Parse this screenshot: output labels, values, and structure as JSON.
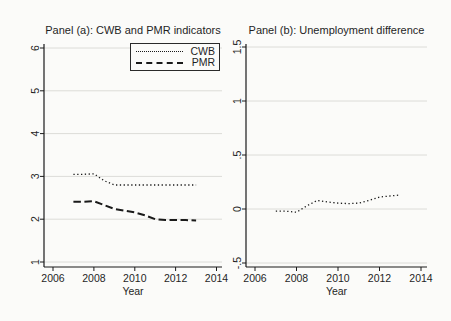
{
  "figure": {
    "background": "#fbfbf9",
    "line_color": "#1a1a1a",
    "grid_color": "#dcdcd8",
    "text_color": "#1f1f1f"
  },
  "chart_data": [
    {
      "id": "panel-a",
      "type": "line",
      "title": "Panel (a): CWB and PMR indicators",
      "xlabel": "Year",
      "ylabel": "",
      "xlim": [
        2006,
        2014
      ],
      "ylim": [
        1,
        6
      ],
      "xticks": [
        2006,
        2008,
        2010,
        2012,
        2014
      ],
      "yticks": [
        1,
        2,
        3,
        4,
        5,
        6
      ],
      "ytick_labels": [
        "1",
        "2",
        "3",
        "4",
        "5",
        "6"
      ],
      "grid": "horizontal",
      "legend_position": "top-right-inside",
      "series": [
        {
          "name": "CWB",
          "style": "dotted",
          "x": [
            2007,
            2007.5,
            2008,
            2008.5,
            2009,
            2009.5,
            2010,
            2010.5,
            2011,
            2011.5,
            2012,
            2012.5,
            2013
          ],
          "y": [
            3.05,
            3.05,
            3.06,
            2.9,
            2.8,
            2.8,
            2.8,
            2.8,
            2.8,
            2.8,
            2.8,
            2.8,
            2.8
          ]
        },
        {
          "name": "PMR",
          "style": "dashed",
          "x": [
            2007,
            2007.5,
            2008,
            2008.5,
            2009,
            2009.5,
            2010,
            2010.5,
            2011,
            2011.5,
            2012,
            2012.5,
            2013
          ],
          "y": [
            2.41,
            2.41,
            2.42,
            2.33,
            2.24,
            2.2,
            2.16,
            2.09,
            2.0,
            1.98,
            1.98,
            1.98,
            1.97
          ]
        }
      ]
    },
    {
      "id": "panel-b",
      "type": "line",
      "title": "Panel (b): Unemployment difference",
      "xlabel": "Year",
      "ylabel": "",
      "xlim": [
        2006,
        2014
      ],
      "ylim": [
        -0.5,
        1.5
      ],
      "xticks": [
        2006,
        2008,
        2010,
        2012,
        2014
      ],
      "yticks": [
        -0.5,
        0,
        0.5,
        1,
        1.5
      ],
      "ytick_labels": [
        "-.5",
        "0",
        ".5",
        "1",
        "1.5"
      ],
      "grid": "horizontal",
      "legend_position": "none",
      "series": [
        {
          "name": "Unemployment difference",
          "style": "dotted",
          "x": [
            2007,
            2007.5,
            2008,
            2008.5,
            2009,
            2009.5,
            2010,
            2010.5,
            2011,
            2011.5,
            2012,
            2012.5,
            2013
          ],
          "y": [
            -0.02,
            -0.02,
            -0.03,
            0.03,
            0.08,
            0.065,
            0.055,
            0.05,
            0.055,
            0.08,
            0.11,
            0.12,
            0.13
          ]
        }
      ]
    }
  ]
}
